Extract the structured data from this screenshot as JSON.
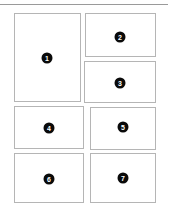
{
  "canvas": {
    "width": 175,
    "height": 217,
    "background": "#ffffff",
    "panel_border_color": "#b5b5b5",
    "badge_color": "#0a0a0a",
    "badge_text_color": "#ffffff",
    "rule_color": "#9a9a9a"
  },
  "divider": {
    "name": "top-horizontal-rule",
    "x": 0,
    "y": 4,
    "width": 168,
    "height": 1
  },
  "panels": [
    {
      "id": "panel-1",
      "badge_label": "1",
      "x": 14,
      "y": 13,
      "width": 67,
      "height": 89,
      "badge_x": 47,
      "badge_y": 58
    },
    {
      "id": "panel-2",
      "badge_label": "2",
      "x": 85,
      "y": 13,
      "width": 71,
      "height": 44,
      "badge_x": 120,
      "badge_y": 37
    },
    {
      "id": "panel-3",
      "badge_label": "3",
      "x": 84,
      "y": 61,
      "width": 72,
      "height": 42,
      "badge_x": 120,
      "badge_y": 83
    },
    {
      "id": "panel-4",
      "badge_label": "4",
      "x": 14,
      "y": 106,
      "width": 70,
      "height": 43,
      "badge_x": 49,
      "badge_y": 128
    },
    {
      "id": "panel-5",
      "badge_label": "5",
      "x": 90,
      "y": 107,
      "width": 66,
      "height": 43,
      "badge_x": 123,
      "badge_y": 127
    },
    {
      "id": "panel-6",
      "badge_label": "6",
      "x": 14,
      "y": 153,
      "width": 70,
      "height": 50,
      "badge_x": 49,
      "badge_y": 179
    },
    {
      "id": "panel-7",
      "badge_label": "7",
      "x": 90,
      "y": 153,
      "width": 66,
      "height": 50,
      "badge_x": 123,
      "badge_y": 178
    }
  ]
}
